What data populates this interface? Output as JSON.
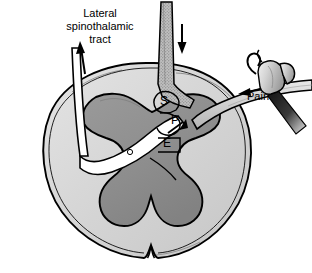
{
  "figure": {
    "type": "anatomical-diagram",
    "background_color": "#ffffff"
  },
  "labels": {
    "tract_title_line1": "Lateral",
    "tract_title_line2": "spinothalamic",
    "tract_title_line3": "tract",
    "pain": "Pain",
    "neuron_s": "S",
    "neuron_p": "P",
    "neuron_e": "E"
  },
  "colors": {
    "white_matter": "#d2d2d2",
    "white_matter_light": "#e2e2e2",
    "gray_matter": "#8f8f8f",
    "gray_matter_dark": "#848484",
    "outline": "#000000",
    "tract_fill": "#ffffff",
    "hammer_head": "#d8d8d8",
    "hammer_handle": "#1a1a1a",
    "nerve_fill": "#c8c8c8",
    "root_stipple": "#b0b0b0"
  },
  "elements": {
    "ascending_arrow": "arrow-up",
    "descending_arrow": "arrow-down",
    "afferent_arrow": "arrow-left",
    "crossing_arrow": "arrow-diagonal",
    "hammer": "claw-hammer-icon",
    "dorsal_root": "dorsal-root-stippled-band",
    "fissure": "anterior-median-fissure"
  }
}
